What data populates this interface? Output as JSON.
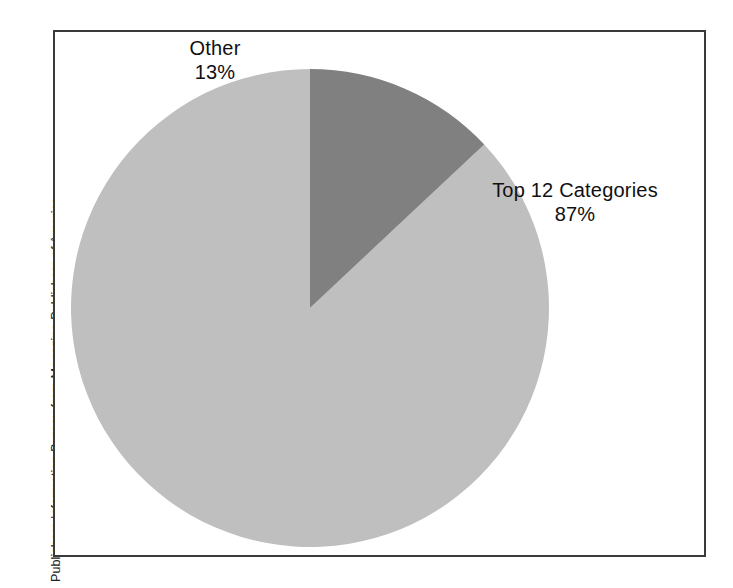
{
  "figure": {
    "source_note": "Publishers Information Bureau from Magazine Publishers of America.",
    "frame_color": "#3a3a3c",
    "background": "#ffffff"
  },
  "chart_data": {
    "type": "pie",
    "title": "",
    "subtitle": "",
    "xlabel": "",
    "ylabel": "",
    "grid": false,
    "legend_position": "none",
    "labels_inline": true,
    "start_angle_deg": 0,
    "direction": "counterclockwise",
    "categories": [
      "Top 12 Categories",
      "Other"
    ],
    "values": [
      87,
      13
    ],
    "units": "percent",
    "slices": [
      {
        "name": "Top 12 Categories",
        "value": 87,
        "value_label": "87%",
        "color": "#bfbfbf",
        "label_position": "right-outside"
      },
      {
        "name": "Other",
        "value": 13,
        "value_label": "13%",
        "color": "#808080",
        "label_position": "top-left-outside"
      }
    ],
    "annotations": [
      "Publishers Information Bureau from Magazine Publishers of America."
    ]
  },
  "pie_geometry": {
    "center_x": 310,
    "center_y": 308,
    "radius": 239
  },
  "labels": {
    "other": {
      "name": "Other",
      "value": "13%"
    },
    "top12": {
      "name": "Top 12 Categories",
      "value": "87%"
    }
  }
}
